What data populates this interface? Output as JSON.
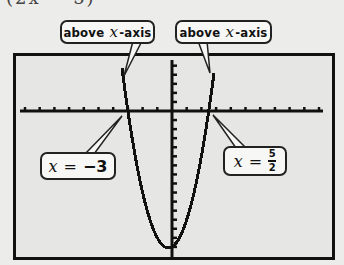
{
  "header": {
    "partial_equation": "(2x − 5)"
  },
  "callouts": {
    "left_top": {
      "prefix": "above ",
      "var": "x",
      "suffix": "-axis"
    },
    "right_top": {
      "prefix": "above ",
      "var": "x",
      "suffix": "-axis"
    },
    "left_bottom": {
      "var": "x",
      "eq": "=",
      "value": "−3"
    },
    "right_bottom": {
      "var": "x",
      "eq": "=",
      "numerator": "5",
      "denominator": "2"
    }
  },
  "colors": {
    "screen_bg": "#e6e6e4",
    "frame": "#111111",
    "curve": "#111111",
    "callout_bg": "#f7f7f5"
  },
  "chart_data": {
    "type": "line",
    "title": "",
    "function": "y = (2x − 5)(x + 3) = 2x² + x − 15",
    "xlabel": "x",
    "ylabel": "y",
    "xlim": [
      -10.5,
      10.3
    ],
    "ylim": [
      -15.5,
      5.5
    ],
    "x_tick_step": 1,
    "y_tick_step": 1,
    "grid": false,
    "zeros": [
      -3,
      2.5
    ],
    "vertex": {
      "x": -0.25,
      "y": -15.125
    },
    "x": [
      -3.5,
      -3,
      -2.5,
      -2,
      -1.5,
      -1,
      -0.5,
      -0.25,
      0,
      0.5,
      1,
      1.5,
      2,
      2.5,
      3
    ],
    "values": [
      6,
      0,
      -5,
      -9,
      -12,
      -14,
      -15,
      -15.125,
      -15,
      -14,
      -12,
      -9,
      -5,
      0,
      6
    ],
    "annotations": [
      {
        "text": "above x-axis",
        "target": "left branch above axis"
      },
      {
        "text": "above x-axis",
        "target": "right branch above axis"
      },
      {
        "text": "x = −3",
        "target": "left zero"
      },
      {
        "text": "x = 5/2",
        "target": "right zero"
      }
    ]
  }
}
